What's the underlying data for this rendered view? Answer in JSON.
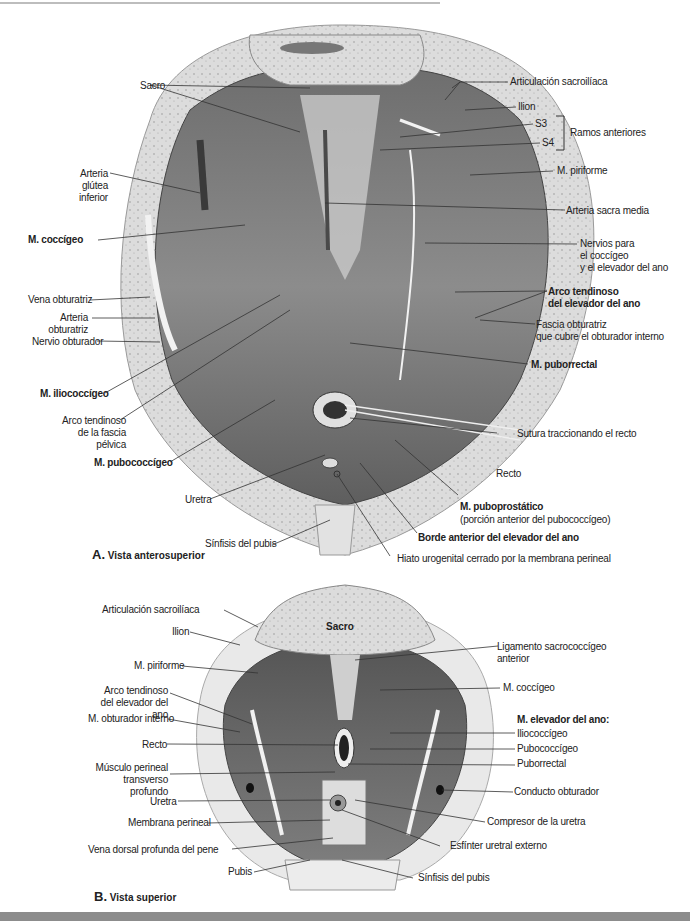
{
  "figure_a": {
    "caption_letter": "A.",
    "caption_text": "Vista anterosuperior",
    "labels_left": {
      "sacro": "Sacro",
      "arteria_glutea_inferior": "Arteria glútea\ninferior",
      "m_coccigeo": "M. coccígeo",
      "vena_obturatriz": "Vena obturatriz",
      "arteria_obturatriz": "Arteria\nobturatriz",
      "nervio_obturador": "Nervio obturador",
      "m_iliococcigeo": "M. iliococcígeo",
      "arco_tendinoso_fascia_pelvica": "Arco tendinoso\nde la fascia pélvica",
      "m_pubococcigeo": "M. pubococcígeo",
      "uretra": "Uretra",
      "sinfisis_pubis": "Sínfisis del pubis"
    },
    "labels_right": {
      "articulacion_sacroiliaca": "Articulación sacroilíaca",
      "ilion": "Ilion",
      "s3": "S3",
      "s4": "S4",
      "ramos_anteriores": "Ramos anteriores",
      "m_piriforme": "M. piriforme",
      "arteria_sacra_media": "Arteria sacra media",
      "nervios_coccigeo_elevador": "Nervios para\nel coccígeo\ny el elevador del ano",
      "arco_tendinoso_elevador": "Arco tendinoso\ndel elevador del ano",
      "fascia_obturatriz": "Fascia obturatriz\nque cubre el obturador interno",
      "m_puborrectal": "M. puborrectal",
      "sutura_recto": "Sutura traccionando el recto",
      "recto": "Recto",
      "m_puboprostatico": "M. puboprostático",
      "m_puboprostatico_note": "(porción anterior del pubococcígeo)",
      "borde_anterior_elevador": "Borde anterior del elevador del ano",
      "hiato_urogenital": "Hiato urogenital cerrado por la membrana perineal"
    }
  },
  "figure_b": {
    "caption_letter": "B.",
    "caption_text": "Vista superior",
    "sacro_tag": "Sacro",
    "labels_left": {
      "articulacion_sacroiliaca": "Articulación sacroilíaca",
      "ilion": "Ilion",
      "m_piriforme": "M. piriforme",
      "arco_tendinoso_elevador": "Arco tendinoso\ndel elevador del ano",
      "m_obturador_interno": "M. obturador interno",
      "recto": "Recto",
      "musculo_perineal": "Músculo perineal\ntransverso profundo",
      "uretra": "Uretra",
      "membrana_perineal": "Membrana perineal",
      "vena_dorsal": "Vena dorsal profunda del pene",
      "pubis": "Pubis"
    },
    "labels_right": {
      "ligamento_sacrococcigeo": "Ligamento sacrococcígeo\nanterior",
      "m_coccigeo": "M. coccígeo",
      "m_elevador_header": "M. elevador del ano:",
      "iliococcigeo": "Iliococcígeo",
      "pubococcigeo": "Pubococcígeo",
      "puborrectal": "Puborrectal",
      "conducto_obturador": "Conducto obturador",
      "compresor_uretra": "Compresor de la uretra",
      "esfinter_uretral": "Esfínter uretral externo",
      "sinfisis_pubis": "Sínfisis del pubis"
    }
  },
  "colors": {
    "bone": "#d9d9d9",
    "muscle_dark": "#5a5a5a",
    "muscle_mid": "#8a8a8a",
    "leader": "#333333",
    "band": "#8c8c8c"
  }
}
